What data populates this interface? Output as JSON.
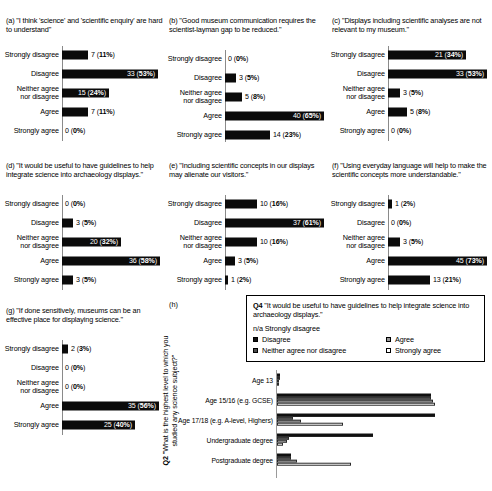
{
  "figure": {
    "likert_categories": [
      "Strongly disagree",
      "Disagree",
      "Neither agree\nnor disagree",
      "Agree",
      "Strongly agree"
    ],
    "panels": [
      {
        "tag": "(a)",
        "caption": "(a) \"I think 'science' and 'scientific enquiry' are hard to understand\"",
        "values": [
          7,
          33,
          15,
          7,
          0
        ],
        "percents": [
          "11%",
          "53%",
          "24%",
          "11%",
          "0%"
        ],
        "labels": [
          "7 (11%)",
          "33 (53%)",
          "15 (24%)",
          "7 (11%)",
          "0 (0%)"
        ]
      },
      {
        "tag": "(b)",
        "caption": "(b) \"Good museum communication requires the scientist-layman gap to be reduced.\"",
        "values": [
          0,
          3,
          5,
          40,
          14
        ],
        "percents": [
          "0%",
          "5%",
          "8%",
          "65%",
          "23%"
        ],
        "labels": [
          "0 (0%)",
          "3 (5%)",
          "5 (8%)",
          "40 (65%)",
          "14 (23%)"
        ]
      },
      {
        "tag": "(c)",
        "caption": "(c) \"Displays including scientific analyses are not relevant to my museum.\"",
        "values": [
          21,
          33,
          3,
          5,
          0
        ],
        "percents": [
          "34%",
          "53%",
          "5%",
          "8%",
          "0%"
        ],
        "labels": [
          "21 (34%)",
          "33 (53%)",
          "3 (5%)",
          "5 (8%)",
          "0 (0%)"
        ]
      },
      {
        "tag": "(d)",
        "caption": "(d) \"It would be useful to have guidelines to help integrate science into archaeology displays.\"",
        "values": [
          0,
          3,
          20,
          36,
          3
        ],
        "percents": [
          "0%",
          "5%",
          "32%",
          "58%",
          "5%"
        ],
        "labels": [
          "0 (0%)",
          "3 (5%)",
          "20 (32%)",
          "36 (58%)",
          "3 (5%)"
        ]
      },
      {
        "tag": "(e)",
        "caption": "(e) \"Including scientific concepts in our displays may alienate our visitors.\"",
        "values": [
          10,
          37,
          10,
          3,
          1
        ],
        "percents": [
          "16%",
          "61%",
          "16%",
          "5%",
          "2%"
        ],
        "labels": [
          "10 (16%)",
          "37 (61%)",
          "10 (16%)",
          "3 (5%)",
          "1 (2%)"
        ]
      },
      {
        "tag": "(f)",
        "caption": "(f) \"Using everyday language will help to make the scientific concepts more understandable.\"",
        "values": [
          1,
          0,
          3,
          45,
          13
        ],
        "percents": [
          "2%",
          "0%",
          "5%",
          "73%",
          "21%"
        ],
        "labels": [
          "1 (2%)",
          "0 (0%)",
          "3 (5%)",
          "45 (73%)",
          "13 (21%)"
        ]
      },
      {
        "tag": "(g)",
        "caption": "(g) \"If done sensitively, museums can be an effective place for displaying science.\"",
        "values": [
          2,
          0,
          0,
          35,
          25
        ],
        "percents": [
          "3%",
          "0%",
          "0%",
          "56%",
          "40%"
        ],
        "labels": [
          "2 (3%)",
          "0 (0%)",
          "0 (0%)",
          "35 (56%)",
          "25 (40%)"
        ]
      }
    ],
    "panel_h": {
      "tag": "(h)",
      "legend": {
        "question_code": "Q4",
        "question_text": "\"It would be useful to have guidelines to help integrate science into archaeology displays.\"",
        "na_text": "n/a Strongly disagree",
        "items": [
          {
            "label": "Disagree",
            "swatch": "solid"
          },
          {
            "label": "Agree",
            "swatch": "mid"
          },
          {
            "label": "Neither agree nor disagree",
            "swatch": "dark"
          },
          {
            "label": "Strongly agree",
            "swatch": "light"
          }
        ]
      },
      "ylabel_code": "Q2",
      "ylabel_text": "\"What is the highest level to which you studied any science subject?\"",
      "categories": [
        "Age 13",
        "Age 15/16 (e.g. GCSE)",
        "Age 17/18 (e.g. A-level, Highers)",
        "Undergraduate degree",
        "Postgraduate degree"
      ],
      "series": [
        {
          "name": "Disagree",
          "swatch": "solid",
          "values": [
            1.5,
            77,
            79,
            48,
            7
          ]
        },
        {
          "name": "Neither agree nor disagree",
          "swatch": "dark",
          "values": [
            1.5,
            77,
            8,
            6,
            7
          ]
        },
        {
          "name": "Agree",
          "swatch": "mid",
          "values": [
            0,
            78,
            12,
            5,
            10
          ]
        },
        {
          "name": "Strongly agree",
          "swatch": "light",
          "values": [
            0,
            79,
            33,
            3,
            37
          ]
        }
      ],
      "xlim": [
        0,
        100
      ]
    }
  }
}
